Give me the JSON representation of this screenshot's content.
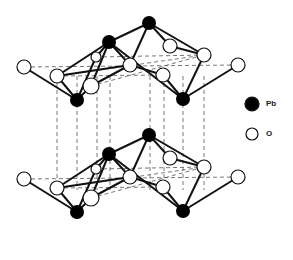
{
  "legend": {
    "items": [
      {
        "label": "Pb",
        "fill": "#000000",
        "x": 252,
        "y": 104,
        "r": 7
      },
      {
        "label": "O",
        "fill": "#ffffff",
        "x": 252,
        "y": 134,
        "r": 6
      }
    ]
  },
  "colors": {
    "pb": "#000000",
    "o": "#ffffff",
    "bond": "#111111",
    "dash": "#555555"
  },
  "layers": [
    {
      "name": "top",
      "dy": 0
    },
    {
      "name": "bottom",
      "dy": 112
    }
  ],
  "structure": {
    "pb": [
      {
        "id": "P1",
        "x": 149,
        "y": 23
      },
      {
        "id": "P2",
        "x": 109,
        "y": 42
      },
      {
        "id": "P3",
        "x": 77,
        "y": 100
      },
      {
        "id": "P4",
        "x": 183,
        "y": 99
      }
    ],
    "o": [
      {
        "id": "O1",
        "x": 24,
        "y": 67,
        "r": 7
      },
      {
        "id": "O2",
        "x": 57,
        "y": 76,
        "r": 7
      },
      {
        "id": "O3",
        "x": 96,
        "y": 57,
        "r": 5
      },
      {
        "id": "O4",
        "x": 91,
        "y": 86,
        "r": 8
      },
      {
        "id": "O5",
        "x": 130,
        "y": 65,
        "r": 7
      },
      {
        "id": "O6",
        "x": 163,
        "y": 75,
        "r": 7
      },
      {
        "id": "O7",
        "x": 170,
        "y": 46,
        "r": 7
      },
      {
        "id": "O8",
        "x": 204,
        "y": 55,
        "r": 7
      },
      {
        "id": "O9",
        "x": 238,
        "y": 65,
        "r": 7
      }
    ],
    "bonds": [
      [
        "O1",
        "P3"
      ],
      [
        "O2",
        "P3"
      ],
      [
        "O4",
        "P3"
      ],
      [
        "O3",
        "P3"
      ],
      [
        "O2",
        "P2"
      ],
      [
        "O4",
        "P2"
      ],
      [
        "O3",
        "P2"
      ],
      [
        "O5",
        "P2"
      ],
      [
        "P2",
        "P1"
      ],
      [
        "P2",
        "P4"
      ],
      [
        "P1",
        "O7"
      ],
      [
        "P1",
        "O5"
      ],
      [
        "P1",
        "O8"
      ],
      [
        "O7",
        "O8"
      ],
      [
        "O5",
        "O6"
      ],
      [
        "O6",
        "P4"
      ],
      [
        "O8",
        "P4"
      ],
      [
        "O9",
        "P4"
      ],
      [
        "O2",
        "O5"
      ],
      [
        "O4",
        "O5"
      ]
    ],
    "dashed_h": [
      [
        24,
        67,
        238,
        65
      ],
      [
        57,
        76,
        204,
        55
      ],
      [
        96,
        57,
        204,
        55
      ],
      [
        57,
        76,
        163,
        75
      ],
      [
        91,
        86,
        204,
        55
      ]
    ],
    "dashed_v_x": [
      57,
      77,
      97,
      110,
      150,
      164,
      183,
      204
    ],
    "dashed_v_range": [
      76,
      190
    ]
  }
}
